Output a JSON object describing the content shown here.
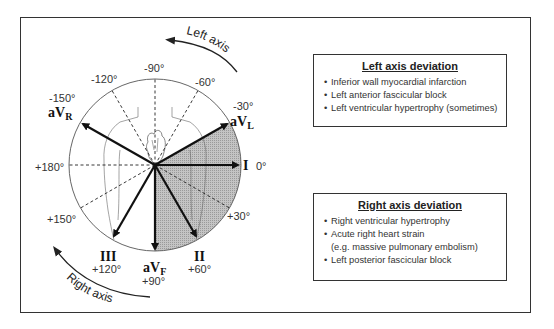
{
  "diagram": {
    "axis_arrows": {
      "left": "Left axis",
      "right": "Right axis"
    },
    "angle_labels": {
      "m90": "-90°",
      "m120": "-120°",
      "m60": "-60°",
      "m150": "-150°",
      "m30": "-30°",
      "p180": "+180°",
      "zero": "0°",
      "p150": "+150°",
      "p30": "+30°",
      "p120": "+120°",
      "p90": "+90°",
      "p60": "+60°"
    },
    "leads": {
      "avr": {
        "base": "aV",
        "sub": "R",
        "angle": -150
      },
      "avl": {
        "base": "aV",
        "sub": "L",
        "angle": -30
      },
      "i": {
        "base": "I",
        "angle": 0
      },
      "ii": {
        "base": "II",
        "angle": 60
      },
      "iii": {
        "base": "III",
        "angle": 120
      },
      "avf": {
        "base": "aV",
        "sub": "F",
        "angle": 90
      }
    },
    "normal_axis_shading": {
      "from_deg": -30,
      "to_deg": 90,
      "color": "#bdbdbd"
    }
  },
  "left_box": {
    "title": "Left axis deviation",
    "items": [
      "Inferior wall myocardial infarction",
      "Left anterior fascicular block",
      "Left ventricular hypertrophy (sometimes)"
    ]
  },
  "right_box": {
    "title": "Right axis deviation",
    "items": [
      "Right ventricular hypertrophy",
      "Acute right heart strain",
      "(e.g. massive pulmonary embolism)",
      "Left posterior fascicular block"
    ],
    "bullet": "•"
  }
}
